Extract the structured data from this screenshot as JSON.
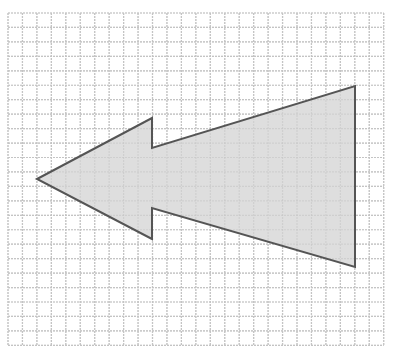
{
  "figure": {
    "type": "grid-diagram",
    "grid": {
      "x0": 8,
      "y0": 13,
      "cols": 26,
      "rows": 23,
      "cell": 14.45,
      "line_color": "#c4c4c4"
    },
    "shape": {
      "name": "left-arrow",
      "points": [
        [
          37,
          179
        ],
        [
          152,
          118
        ],
        [
          152,
          148
        ],
        [
          355,
          86
        ],
        [
          355,
          267
        ],
        [
          152,
          208
        ],
        [
          152,
          239
        ]
      ],
      "fill": "#dedede",
      "stroke": "#555555",
      "stroke_width": 2
    }
  }
}
